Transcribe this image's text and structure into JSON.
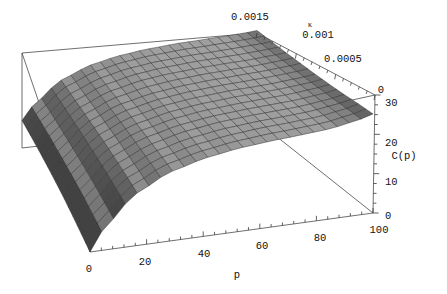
{
  "figure": {
    "kind": "3d-surface-plot",
    "width": 447,
    "height": 294,
    "background": "#ffffff",
    "line_color": "#4a4a4a",
    "mesh_color": "#2b2b2b",
    "surface_light": "#d8d8d8",
    "surface_dark": "#4c4c4c"
  },
  "axes": {
    "x": {
      "name": "p-axis",
      "title": "p",
      "ticks": [
        "0",
        "20",
        "40",
        "60",
        "80",
        "100"
      ],
      "values": [
        0,
        20,
        40,
        60,
        80,
        100
      ],
      "range": [
        0,
        100
      ],
      "minor_per_interval": 4
    },
    "y": {
      "name": "kappa-axis",
      "title": "κ",
      "ticks": [
        "0.0015",
        "0.001",
        "0.0005",
        "0"
      ],
      "values": [
        0.0015,
        0.001,
        0.0005,
        0
      ],
      "range": [
        0,
        0.0015
      ],
      "minor_per_interval": 4
    },
    "z": {
      "name": "c-of-p-axis",
      "title": "C(p)",
      "ticks": [
        "0",
        "10",
        "20",
        "30"
      ],
      "values": [
        0,
        10,
        20,
        30
      ],
      "range": [
        0,
        30
      ],
      "minor_per_interval": 4
    }
  },
  "chart_data": {
    "type": "surface",
    "title": "",
    "xlabel": "p",
    "ylabel": "κ",
    "zlabel": "C(p)",
    "xlim": [
      0,
      100
    ],
    "ylim": [
      0,
      0.0015
    ],
    "zlim": [
      0,
      30
    ],
    "grid": false,
    "legend": false,
    "mesh_nx": 24,
    "mesh_ny": 16,
    "x": [
      0,
      6.25,
      12.5,
      18.75,
      25,
      31.25,
      37.5,
      43.75,
      50,
      56.25,
      62.5,
      68.75,
      75,
      81.25,
      87.5,
      93.75,
      100
    ],
    "y": [
      0,
      0.0001875,
      0.000375,
      0.0005625,
      0.00075,
      0.0009375,
      0.001125,
      0.0013125,
      0.0015
    ],
    "z": [
      [
        0.0,
        6.5,
        11.0,
        14.2,
        16.5,
        18.1,
        19.3,
        20.2,
        20.9,
        21.4,
        21.8,
        22.1,
        22.4,
        22.7,
        23.2,
        24.0,
        25.2
      ],
      [
        1.2,
        7.4,
        11.7,
        14.8,
        16.9,
        18.4,
        19.5,
        20.3,
        21.0,
        21.5,
        21.9,
        22.2,
        22.4,
        22.7,
        23.1,
        23.8,
        24.8
      ],
      [
        2.4,
        8.3,
        12.3,
        15.2,
        17.2,
        18.6,
        19.7,
        20.5,
        21.1,
        21.6,
        21.9,
        22.2,
        22.4,
        22.6,
        23.0,
        23.5,
        24.3
      ],
      [
        3.5,
        9.0,
        12.8,
        15.6,
        17.5,
        18.8,
        19.8,
        20.6,
        21.2,
        21.6,
        21.9,
        22.2,
        22.4,
        22.6,
        22.9,
        23.3,
        23.9
      ],
      [
        4.4,
        9.6,
        13.2,
        15.9,
        17.7,
        19.0,
        19.9,
        20.7,
        21.2,
        21.6,
        21.9,
        22.2,
        22.3,
        22.5,
        22.8,
        23.1,
        23.6
      ],
      [
        5.2,
        10.1,
        13.6,
        16.1,
        17.9,
        19.1,
        20.0,
        20.7,
        21.2,
        21.6,
        21.9,
        22.1,
        22.3,
        22.5,
        22.7,
        23.0,
        23.4
      ],
      [
        5.9,
        10.6,
        13.9,
        16.3,
        18.0,
        19.2,
        20.1,
        20.8,
        21.3,
        21.6,
        21.9,
        22.1,
        22.3,
        22.4,
        22.6,
        22.9,
        23.2
      ],
      [
        6.5,
        11.0,
        14.2,
        16.5,
        18.1,
        19.3,
        20.2,
        20.8,
        21.3,
        21.6,
        21.9,
        22.1,
        22.2,
        22.4,
        22.6,
        22.8,
        23.1
      ],
      [
        7.0,
        11.3,
        14.4,
        16.7,
        18.2,
        19.4,
        20.2,
        20.8,
        21.3,
        21.6,
        21.9,
        22.1,
        22.2,
        22.4,
        22.5,
        22.7,
        23.0
      ]
    ]
  }
}
